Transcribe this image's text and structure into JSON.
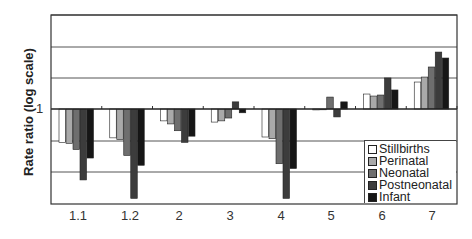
{
  "chart_data": {
    "type": "bar",
    "title": "",
    "xlabel": "",
    "ylabel": "Rate ratio (log scale)",
    "y_scale": "log",
    "y_tick_labels": [
      "1"
    ],
    "ylim": [
      0.125,
      8
    ],
    "grid": true,
    "legend_position": "lower right",
    "categories": [
      "1.1",
      "1.2",
      "2",
      "3",
      "4",
      "5",
      "6",
      "7"
    ],
    "series": [
      {
        "name": "Stillbirths",
        "color": "#ffffff",
        "values": [
          0.48,
          0.53,
          0.77,
          0.75,
          0.54,
          0.98,
          1.39,
          1.81
        ]
      },
      {
        "name": "Perinatal",
        "color": "#a9a9a9",
        "values": [
          0.47,
          0.51,
          0.72,
          0.77,
          0.52,
          0.99,
          1.33,
          2.02
        ]
      },
      {
        "name": "Neonatal",
        "color": "#6e6e6e",
        "values": [
          0.41,
          0.36,
          0.62,
          0.82,
          0.3,
          1.3,
          1.36,
          2.52
        ]
      },
      {
        "name": "Postneonatal",
        "color": "#3c3c3c",
        "values": [
          0.21,
          0.14,
          0.48,
          1.17,
          0.14,
          0.84,
          1.98,
          3.5
        ]
      },
      {
        "name": "Infant",
        "color": "#161616",
        "values": [
          0.34,
          0.29,
          0.55,
          0.92,
          0.27,
          1.17,
          1.52,
          3.07
        ]
      }
    ]
  }
}
